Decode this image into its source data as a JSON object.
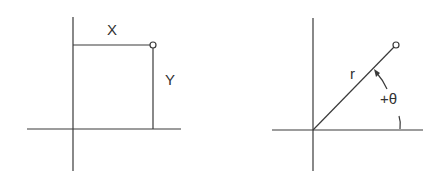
{
  "diagrams": [
    {
      "name": "cartesian-coordinates",
      "labels": {
        "x": "X",
        "y": "Y"
      },
      "origin": [
        73,
        129
      ],
      "point": [
        153,
        45
      ]
    },
    {
      "name": "polar-coordinates",
      "labels": {
        "radius": "r",
        "angle": "+θ"
      },
      "origin": [
        313,
        130
      ],
      "point": [
        396,
        45
      ]
    }
  ],
  "colors": {
    "line": "#3a3a3a",
    "text": "#333333",
    "background": "#ffffff"
  }
}
